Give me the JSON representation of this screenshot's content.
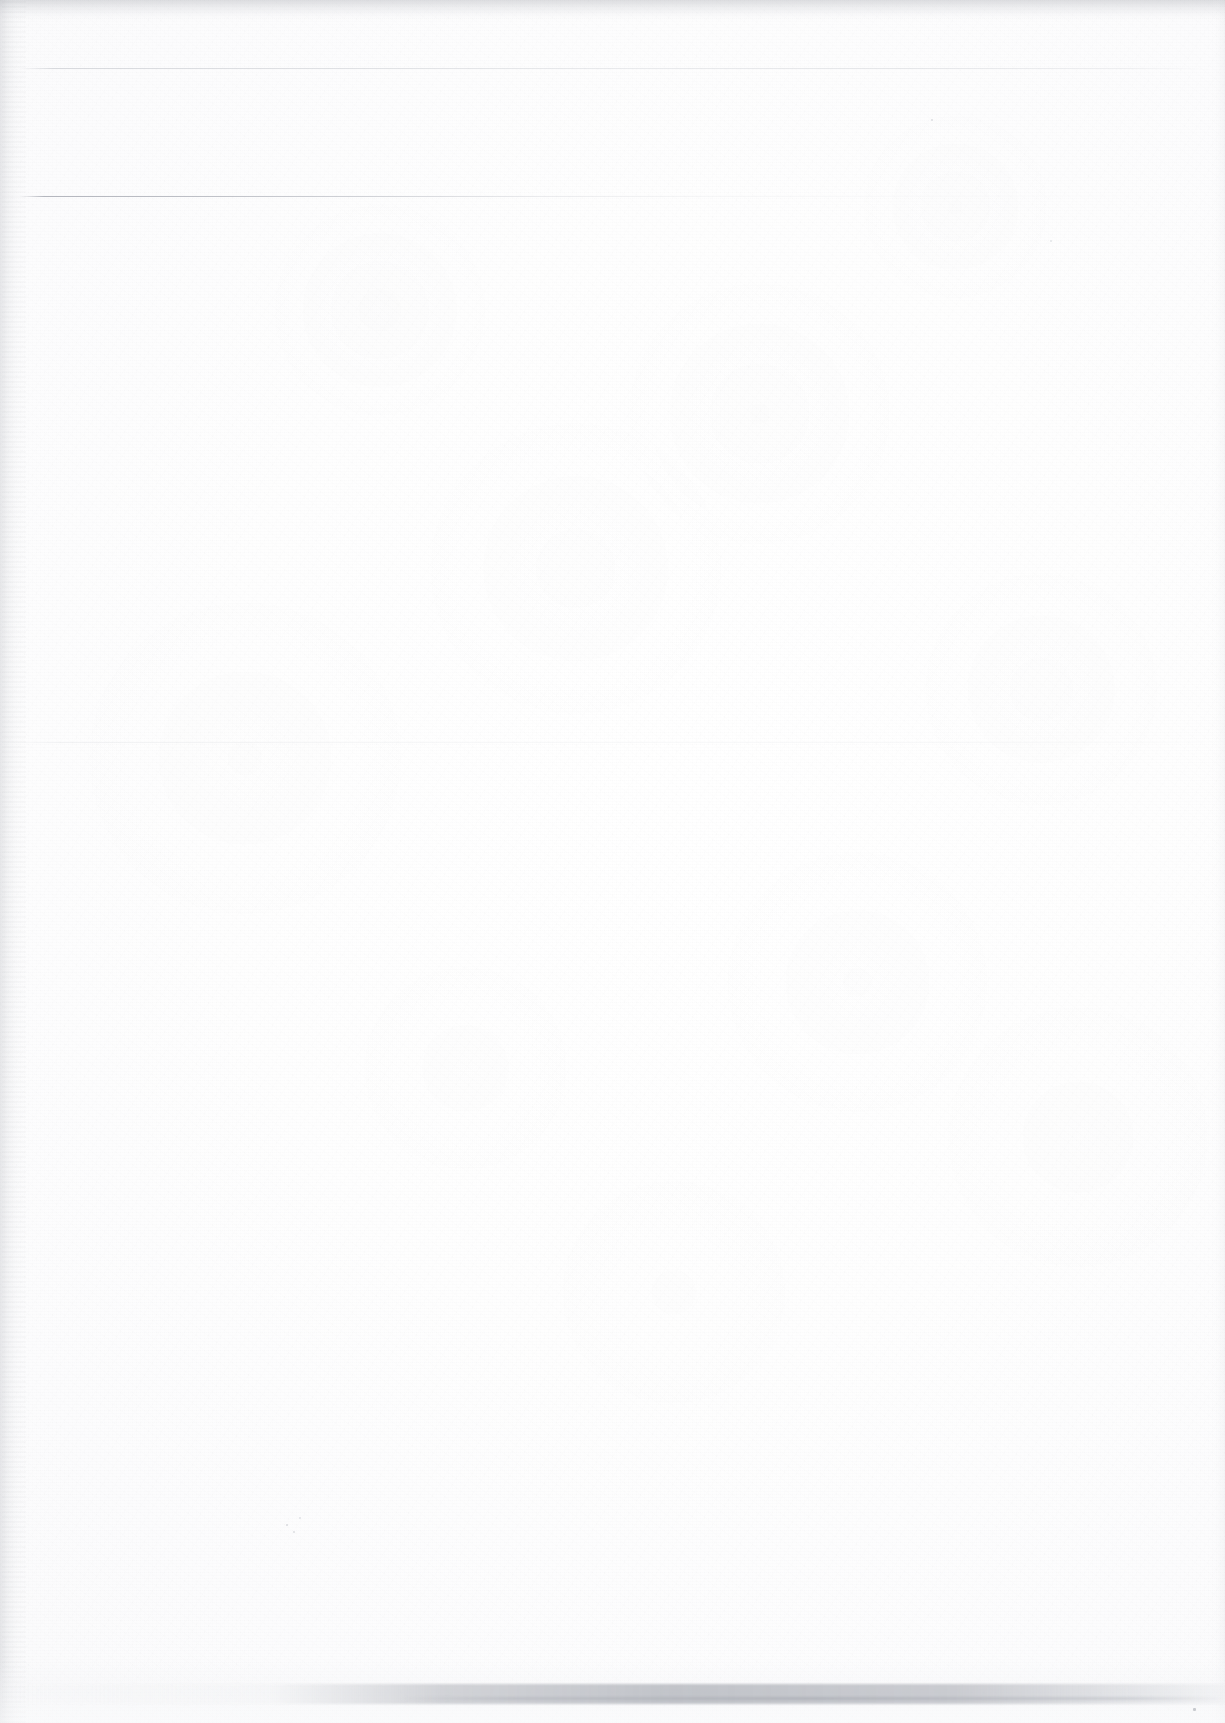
{
  "document": {
    "kind": "scanned-page",
    "description": "Blank scanned document page",
    "visible_text": "",
    "width_px": 1225,
    "height_px": 1723,
    "background_color": "#fdfdfd",
    "paper_tone": "#ffffff"
  },
  "artifacts": {
    "rules": [
      {
        "name": "rule-top",
        "y": 68,
        "x": 18,
        "width": 1190,
        "color": "#c0c3c9",
        "note": "faint full-width horizontal rule"
      },
      {
        "name": "rule-upper",
        "y": 196,
        "x": 20,
        "width": 1186,
        "color": "#a2a5ae",
        "note": "faint rule, darkest at left, fades toward right"
      },
      {
        "name": "rule-middle",
        "y": 742,
        "x": 0,
        "width": 1225,
        "color": "#dcdee2",
        "note": "very faint full-width horizontal rule"
      }
    ],
    "shadows": [
      {
        "name": "top-edge-shadow",
        "edge": "top",
        "extent_px": 22,
        "color": "#acaeb4"
      },
      {
        "name": "left-gutter-shadow",
        "edge": "left",
        "extent_px": 27,
        "color": "#b2b4ba"
      },
      {
        "name": "right-edge-shadow",
        "edge": "right",
        "extent_px": 14,
        "color": "#cdcfd4"
      },
      {
        "name": "bottom-edge-band",
        "edge": "bottom",
        "y": 1684,
        "extent_px": 20,
        "color": "#acaf b6"
      }
    ],
    "specks": [
      {
        "name": "speck-a",
        "x": 286,
        "y": 1524,
        "size": 2,
        "color": "#d8dade"
      },
      {
        "name": "speck-b",
        "x": 293,
        "y": 1531,
        "size": 2,
        "color": "#dcdee2"
      },
      {
        "name": "speck-c",
        "x": 299,
        "y": 1517,
        "size": 2,
        "color": "#e0e2e6"
      },
      {
        "name": "speck-d",
        "x": 1193,
        "y": 1708,
        "size": 3,
        "color": "#9ea1a8"
      },
      {
        "name": "speck-e",
        "x": 931,
        "y": 119,
        "size": 2,
        "color": "#dcdee2"
      },
      {
        "name": "speck-f",
        "x": 1050,
        "y": 240,
        "size": 2,
        "color": "#e2e4e7"
      }
    ],
    "texture": {
      "name": "paper-grain",
      "type": "scan-noise",
      "intensity": "low"
    }
  }
}
